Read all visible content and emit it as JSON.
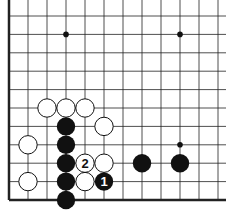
{
  "diagram": {
    "type": "go-board-fragment",
    "grid": {
      "x0": 9,
      "dx": 19,
      "cols": 12,
      "yBottom": 200,
      "dy": 18.4,
      "rows": 11,
      "left_edge": true,
      "bottom_edge": true
    },
    "star_points": [
      [
        3,
        9
      ],
      [
        9,
        9
      ],
      [
        9,
        3
      ]
    ],
    "stones": [
      {
        "color": "white",
        "col": 2,
        "row": 5
      },
      {
        "color": "white",
        "col": 3,
        "row": 5
      },
      {
        "color": "white",
        "col": 4,
        "row": 5
      },
      {
        "color": "white",
        "col": 5,
        "row": 4
      },
      {
        "color": "white",
        "col": 1,
        "row": 3
      },
      {
        "color": "white",
        "col": 1,
        "row": 1
      },
      {
        "color": "white",
        "col": 4,
        "row": 2,
        "label": "2"
      },
      {
        "color": "white",
        "col": 5,
        "row": 2
      },
      {
        "color": "white",
        "col": 4,
        "row": 1
      },
      {
        "color": "black",
        "col": 3,
        "row": 4
      },
      {
        "color": "black",
        "col": 3,
        "row": 3
      },
      {
        "color": "black",
        "col": 3,
        "row": 2
      },
      {
        "color": "black",
        "col": 3,
        "row": 1
      },
      {
        "color": "black",
        "col": 3,
        "row": 0
      },
      {
        "color": "black",
        "col": 5,
        "row": 1,
        "label": "1"
      },
      {
        "color": "black",
        "col": 7,
        "row": 2
      },
      {
        "color": "black",
        "col": 9,
        "row": 2
      }
    ]
  }
}
